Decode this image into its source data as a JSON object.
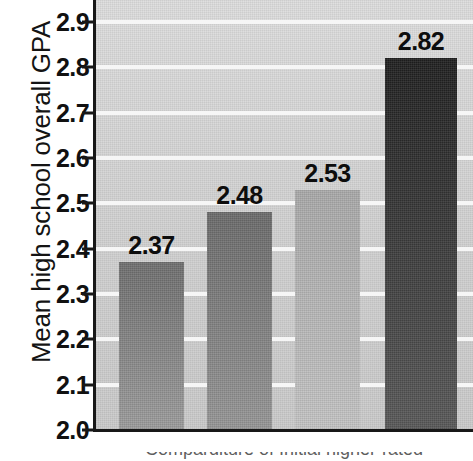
{
  "chart_data": {
    "type": "bar",
    "title": "",
    "subtitle": "",
    "xlabel": "Comparditure of Initial higher-rated",
    "ylabel": "Mean high school overall GPA",
    "categories": [
      "",
      "",
      "",
      ""
    ],
    "values": [
      2.37,
      2.48,
      2.53,
      2.82
    ],
    "data_labels": [
      "2.37",
      "2.48",
      "2.53",
      "2.82"
    ],
    "ylim": [
      2.0,
      2.9
    ],
    "ytick_labels": [
      "2.0",
      "2.1",
      "2.2",
      "2.3",
      "2.4",
      "2.5",
      "2.6",
      "2.7",
      "2.8",
      "2.9"
    ],
    "ytick_values": [
      2.0,
      2.1,
      2.2,
      2.3,
      2.4,
      2.5,
      2.6,
      2.7,
      2.8,
      2.9
    ],
    "xtick_labels": [],
    "grid": "horizontal",
    "legend": "none",
    "bar_colors_top": [
      "#6e6e6e",
      "#6a6a6a",
      "#a9a9a9",
      "#1f1f1f"
    ],
    "bar_colors_bottom": [
      "#9c9c9c",
      "#969696",
      "#c4c4c4",
      "#585858"
    ],
    "plot_background": "#d3d3d3",
    "gridline_color": "#f6f6f6",
    "axis_color": "#181818",
    "label_text_color": "#0d0d0d"
  },
  "axes": {
    "y_title": "Mean high school overall GPA"
  }
}
